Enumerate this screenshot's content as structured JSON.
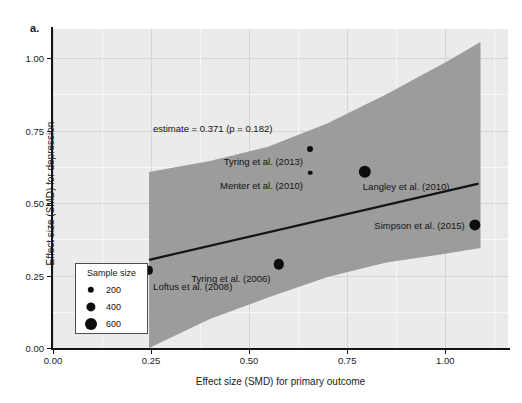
{
  "panel_label": "a.",
  "legend": {
    "title": "Sample size",
    "items": [
      {
        "label": "200",
        "value": 200,
        "radius_px": 3.2
      },
      {
        "label": "400",
        "value": 400,
        "radius_px": 4.6
      },
      {
        "label": "600",
        "value": 600,
        "radius_px": 6.0
      }
    ]
  },
  "chart_data": {
    "type": "scatter",
    "title": "",
    "xlabel": "Effect size (SMD) for primary outcome",
    "ylabel": "Effect size (SMD) for depression",
    "xlim": [
      0.0,
      1.16
    ],
    "ylim": [
      0.0,
      1.1
    ],
    "xticks": [
      "0.00",
      "0.25",
      "0.50",
      "0.75",
      "1.00"
    ],
    "xtick_values": [
      0.0,
      0.25,
      0.5,
      0.75,
      1.0
    ],
    "yticks": [
      "0.00",
      "0.25",
      "0.50",
      "0.75",
      "1.00"
    ],
    "ytick_values": [
      0.0,
      0.25,
      0.5,
      0.75,
      1.0
    ],
    "grid": true,
    "legend_position": "bottom-left",
    "annotation": "estimate = 0.371 (p = 0.182)",
    "annotation_at": {
      "x": 0.255,
      "y": 0.755
    },
    "points": [
      {
        "name": "Loftus et al. (2008)",
        "x": 0.245,
        "y": 0.268,
        "n": 360,
        "radius_px": 4.2,
        "label_dx": 4,
        "label_dy": 16,
        "label_anchor": "start"
      },
      {
        "name": "Tyring et al. (2006)",
        "x": 0.575,
        "y": 0.288,
        "n": 520,
        "radius_px": 5.2,
        "label_dx": -8,
        "label_dy": 14,
        "label_anchor": "end"
      },
      {
        "name": "Tyring et al. (2013)",
        "x": 0.655,
        "y": 0.685,
        "n": 180,
        "radius_px": 3.0,
        "label_dx": -7,
        "label_dy": 12,
        "label_anchor": "end"
      },
      {
        "name": "Menter et al. (2010)",
        "x": 0.655,
        "y": 0.605,
        "n": 130,
        "radius_px": 2.3,
        "label_dx": -7,
        "label_dy": 12,
        "label_anchor": "end"
      },
      {
        "name": "Langley et al. (2010)",
        "x": 0.795,
        "y": 0.607,
        "n": 620,
        "radius_px": 6.2,
        "label_dx": -2,
        "label_dy": 14,
        "label_anchor": "start"
      },
      {
        "name": "Simpson et al. (2015)",
        "x": 1.075,
        "y": 0.425,
        "n": 560,
        "radius_px": 5.6,
        "label_dx": -10,
        "label_dy": 0,
        "label_anchor": "end"
      }
    ],
    "fit_line": {
      "x_start": 0.245,
      "y_start": 0.304,
      "x_end": 1.085,
      "y_end": 0.567,
      "slope": 0.371,
      "p_value": 0.182
    },
    "confidence_band": {
      "x_start": 0.245,
      "x_end": 1.09,
      "upper": [
        {
          "x": 0.245,
          "y": 0.607
        },
        {
          "x": 0.4,
          "y": 0.645
        },
        {
          "x": 0.55,
          "y": 0.695
        },
        {
          "x": 0.7,
          "y": 0.775
        },
        {
          "x": 0.85,
          "y": 0.875
        },
        {
          "x": 1.0,
          "y": 0.985
        },
        {
          "x": 1.09,
          "y": 1.055
        }
      ],
      "lower": [
        {
          "x": 0.245,
          "y": 0.0
        },
        {
          "x": 0.4,
          "y": 0.1
        },
        {
          "x": 0.55,
          "y": 0.175
        },
        {
          "x": 0.7,
          "y": 0.245
        },
        {
          "x": 0.85,
          "y": 0.295
        },
        {
          "x": 1.0,
          "y": 0.325
        },
        {
          "x": 1.09,
          "y": 0.345
        }
      ]
    }
  },
  "colors": {
    "panel_background": "#ebebeb",
    "grid_major": "#d4d4d4",
    "grid_minor": "#f7f7f7",
    "point": "#0d0d0d",
    "fit_line": "#141414",
    "confidence_band": "#9c9c9c",
    "axis": "#141414",
    "figure_background": "#ffffff"
  }
}
